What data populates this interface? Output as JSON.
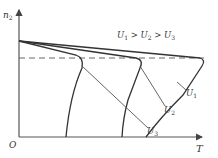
{
  "figure": {
    "y_axis_label": "n",
    "y_axis_label_sub": "2",
    "x_axis_label": "T",
    "origin_label": "O",
    "relation_text": {
      "parts": [
        "U",
        "1",
        " > ",
        "U",
        "2",
        " > ",
        "U",
        "3"
      ]
    },
    "curves": [
      {
        "label": "U",
        "sub": "1"
      },
      {
        "label": "U",
        "sub": "2"
      },
      {
        "label": "U",
        "sub": "3"
      }
    ],
    "colors": {
      "axis": "#555555",
      "curve": "#333333",
      "dashed": "#666666",
      "text": "#333333"
    }
  }
}
